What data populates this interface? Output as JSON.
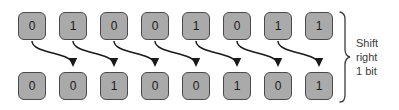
{
  "diagram": {
    "title": "Shift right 1 bit",
    "background_color": "#ffffff",
    "cell_fill_color": "#aaaaaa",
    "cell_border_color": "#4a4a4a",
    "text_color": "#1c1c1c",
    "arrow_color": "#1a1a1a",
    "brace_color": "#3a3a3a",
    "rows": [
      {
        "name": "input-bits",
        "bits": [
          "0",
          "1",
          "0",
          "0",
          "1",
          "0",
          "1",
          "1"
        ]
      },
      {
        "name": "output-bits",
        "bits": [
          "0",
          "0",
          "1",
          "0",
          "0",
          "1",
          "0",
          "1"
        ]
      }
    ],
    "arrows": [
      {
        "from_index": 0,
        "to_index": 1
      },
      {
        "from_index": 1,
        "to_index": 2
      },
      {
        "from_index": 2,
        "to_index": 3
      },
      {
        "from_index": 3,
        "to_index": 4
      },
      {
        "from_index": 4,
        "to_index": 5
      },
      {
        "from_index": 5,
        "to_index": 6
      },
      {
        "from_index": 6,
        "to_index": 7
      }
    ],
    "annotation": {
      "line1": "Shift",
      "line2": "right",
      "line3": "1 bit"
    },
    "layout": {
      "cell_width": 28,
      "cell_height": 28,
      "cell_pitch": 41,
      "first_cell_x": 18,
      "top_row_y": 12,
      "bottom_row_y": 72,
      "brace_x": 345,
      "brace_top": 12,
      "brace_bottom": 102
    }
  }
}
